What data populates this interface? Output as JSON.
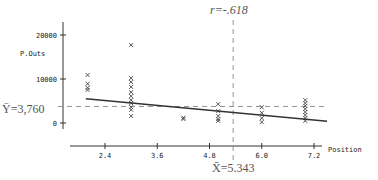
{
  "chart_data": {
    "type": "scatter",
    "title": "",
    "xlabel": "Position",
    "ylabel": "P.Outs",
    "xlim": [
      1.6,
      7.6
    ],
    "ylim": [
      0,
      21000
    ],
    "x_ticks": [
      2.4,
      3.6,
      4.8,
      6.0,
      7.2
    ],
    "x_tick_labels": [
      "2.4",
      "3.6",
      "4.8",
      "6.0",
      "7.2"
    ],
    "y_ticks": [
      0,
      10000,
      20000
    ],
    "y_tick_labels": [
      "0",
      "10000",
      "20000"
    ],
    "grid": false,
    "correlation_label": "r=-.618",
    "mean_y": 3760,
    "mean_y_label": "Ȳ=3,760",
    "mean_x": 5.343,
    "mean_x_label": "X̄=5.343",
    "regression_line": {
      "x": [
        1.96,
        7.5
      ],
      "y": [
        5500,
        400
      ]
    },
    "series": [
      {
        "name": "players",
        "marker": "x",
        "points": [
          [
            2.0,
            10900
          ],
          [
            2.0,
            8900
          ],
          [
            2.0,
            8000
          ],
          [
            2.0,
            7500
          ],
          [
            3.0,
            17700
          ],
          [
            3.0,
            10200
          ],
          [
            3.0,
            9300
          ],
          [
            3.0,
            8200
          ],
          [
            3.0,
            7000
          ],
          [
            3.0,
            6100
          ],
          [
            3.0,
            5200
          ],
          [
            3.0,
            4500
          ],
          [
            3.0,
            3600
          ],
          [
            3.0,
            3000
          ],
          [
            3.0,
            1600
          ],
          [
            4.2,
            1200
          ],
          [
            4.2,
            900
          ],
          [
            5.0,
            4300
          ],
          [
            5.0,
            2700
          ],
          [
            5.0,
            1600
          ],
          [
            5.0,
            900
          ],
          [
            5.0,
            500
          ],
          [
            6.0,
            3600
          ],
          [
            6.0,
            2300
          ],
          [
            6.0,
            1100
          ],
          [
            6.0,
            200
          ],
          [
            7.0,
            5200
          ],
          [
            7.0,
            4500
          ],
          [
            7.0,
            3900
          ],
          [
            7.0,
            3200
          ],
          [
            7.0,
            2500
          ],
          [
            7.0,
            1800
          ],
          [
            7.0,
            1100
          ],
          [
            7.0,
            500
          ]
        ]
      }
    ]
  }
}
